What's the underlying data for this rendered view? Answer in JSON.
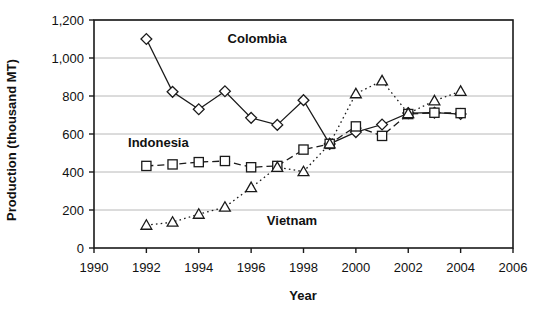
{
  "chart_data": {
    "type": "line",
    "title": "",
    "xlabel": "Year",
    "ylabel": "Production (thousand MT)",
    "xlim": [
      1990,
      2006
    ],
    "ylim": [
      0,
      1200
    ],
    "xticks": [
      1990,
      1992,
      1994,
      1996,
      1998,
      2000,
      2002,
      2004,
      2006
    ],
    "xtick_labels": [
      "1990",
      "1992",
      "1994",
      "1996",
      "1998",
      "2000",
      "2002",
      "2004",
      "2006"
    ],
    "yticks": [
      0,
      200,
      400,
      600,
      800,
      1000,
      1200
    ],
    "ytick_labels": [
      "0",
      "200",
      "400",
      "600",
      "800",
      "1,000",
      "1,200"
    ],
    "grid": "horizontal",
    "legend_position": "inline-annotations",
    "series": [
      {
        "name": "Colombia",
        "marker": "diamond",
        "linestyle": "solid",
        "label_x": 1995.1,
        "label_y": 1105,
        "x": [
          1992,
          1993,
          1994,
          1995,
          1996,
          1997,
          1998,
          1999,
          2000,
          2001,
          2002,
          2003,
          2004
        ],
        "values": [
          1100,
          822,
          730,
          825,
          685,
          648,
          778,
          548,
          610,
          650,
          710,
          712,
          705
        ]
      },
      {
        "name": "Indonesia",
        "marker": "square",
        "linestyle": "dashed",
        "label_x": 1991.3,
        "label_y": 560,
        "x": [
          1992,
          1993,
          1994,
          1995,
          1996,
          1997,
          1998,
          1999,
          2000,
          2001,
          2002,
          2003,
          2004
        ],
        "values": [
          432,
          440,
          452,
          458,
          425,
          432,
          518,
          548,
          640,
          590,
          705,
          712,
          710
        ]
      },
      {
        "name": "Vietnam",
        "marker": "triangle",
        "linestyle": "dotted",
        "label_x": 1996.6,
        "label_y": 150,
        "x": [
          1992,
          1993,
          1994,
          1995,
          1996,
          1997,
          1998,
          1999,
          2000,
          2001,
          2002,
          2003,
          2004
        ],
        "values": [
          120,
          136,
          178,
          215,
          318,
          425,
          402,
          548,
          812,
          880,
          708,
          775,
          825
        ]
      }
    ]
  },
  "colors": {
    "axis": "#1a1a1a",
    "grid": "#b8b8b8",
    "marker_fill": "#ffffff",
    "series_line": "#1a1a1a",
    "text": "#111111",
    "background": "#ffffff"
  }
}
